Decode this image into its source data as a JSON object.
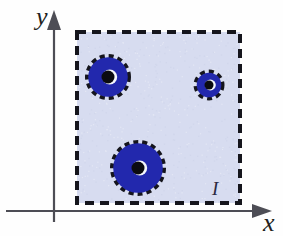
{
  "figure": {
    "background_color": "#fefefe",
    "width": 283,
    "height": 236
  },
  "axes": {
    "x_label": "x",
    "y_label": "y",
    "x_label_pos": {
      "x": 263,
      "y": 231
    },
    "y_label_pos": {
      "x": 36,
      "y": 25
    },
    "axis_color": "#4d4d55",
    "axis_stroke_width": 2.2,
    "x_axis": {
      "x1": 6,
      "y1": 211,
      "x2": 252,
      "y2": 211
    },
    "y_axis": {
      "x1": 54,
      "y1": 222,
      "x2": 54,
      "y2": 22
    },
    "arrowheads": [
      {
        "name": "x-axis-arrowhead",
        "points": "252,204 272,211 252,218"
      },
      {
        "name": "y-axis-arrowhead",
        "points": "47,30 54,10 61,30"
      }
    ]
  },
  "region": {
    "label": "I",
    "label_pos": {
      "x": 212,
      "y": 195
    },
    "fill_color": "#d7dcf0",
    "border_color": "#15151c",
    "border_style": "dashed",
    "border_width": 4,
    "dash_pattern": "9 6",
    "bounds": {
      "x": 77,
      "y": 32,
      "width": 163,
      "height": 171
    }
  },
  "holes": {
    "fill_color": "#2228ad",
    "edge_color": "#15151c",
    "hole_color": "#0b0b10",
    "highlight_color": "#f4f6fc",
    "dash_pattern": "5 4",
    "dash_width": 4,
    "items": [
      {
        "name": "annulus-top-left",
        "cx": 108,
        "cy": 77,
        "r_outer": 21,
        "r_inner": 6.5,
        "highlight_offset_x": 1.8
      },
      {
        "name": "annulus-right",
        "cx": 209,
        "cy": 85,
        "r_outer": 13.5,
        "r_inner": 4.5,
        "highlight_offset_x": 1.4
      },
      {
        "name": "annulus-bottom",
        "cx": 138,
        "cy": 168,
        "r_outer": 26,
        "r_inner": 6.5,
        "highlight_offset_x": 1.8
      }
    ]
  }
}
